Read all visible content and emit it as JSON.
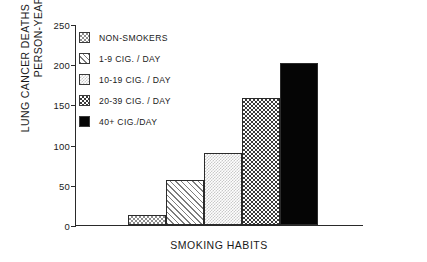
{
  "chart_data": {
    "type": "bar",
    "title": "",
    "xlabel": "SMOKING HABITS",
    "ylabel_line1": "LUNG CANCER DEATHS PER 100,000",
    "ylabel_line2": "PERSON-YEARS",
    "categories": [
      "NON-SMOKERS",
      "1-9 CIG. / DAY",
      "10-19 CIG. / DAY",
      "20-39 CIG. / DAY",
      "40+ CIG./DAY"
    ],
    "values": [
      13,
      56,
      90,
      158,
      201
    ],
    "ylim": [
      0,
      250
    ],
    "yticks": [
      0,
      50,
      100,
      150,
      200,
      250
    ],
    "ytick_labels": [
      "0",
      "50",
      "100",
      "150",
      "200",
      "250"
    ],
    "grid": false,
    "legend_position": "upper-left-inside",
    "xtick_labels": [],
    "series": [
      {
        "name": "lung cancer death rate",
        "values": [
          13,
          56,
          90,
          158,
          201
        ]
      }
    ],
    "bar_patterns": [
      "pat-checkdark",
      "pat-diag",
      "pat-dotlight",
      "pat-checkbold",
      "pat-solid"
    ]
  },
  "legend": {
    "items": [
      {
        "label": "NON-SMOKERS",
        "pattern": "pat-checkdark"
      },
      {
        "label": "1-9 CIG. / DAY",
        "pattern": "pat-diag"
      },
      {
        "label": "10-19 CIG. / DAY",
        "pattern": "pat-dotlight"
      },
      {
        "label": "20-39 CIG. / DAY",
        "pattern": "pat-checkbold"
      },
      {
        "label": "40+ CIG./DAY",
        "pattern": "pat-solid"
      }
    ]
  },
  "colors": {
    "background": "#ffffff",
    "axis": "#2a2a2a",
    "text": "#1a1a1a",
    "solid_bar": "#050505"
  }
}
